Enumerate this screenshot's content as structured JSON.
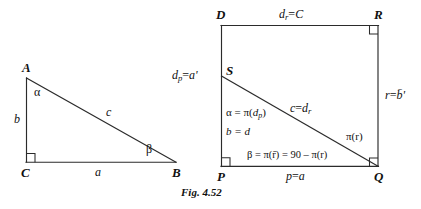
{
  "figure": {
    "caption": "Fig. 4.52",
    "line_color": "#2b2b2b",
    "text_color": "#111111",
    "background": "#ffffff"
  },
  "left_diagram": {
    "name": "right-triangle-ABC",
    "vertices": [
      {
        "id": "A",
        "label": "A",
        "x": 26,
        "y": 78
      },
      {
        "id": "C",
        "label": "C",
        "x": 26,
        "y": 162
      },
      {
        "id": "B",
        "label": "B",
        "x": 176,
        "y": 162
      }
    ],
    "sides": [
      {
        "id": "b",
        "label": "b",
        "from": "A",
        "to": "C"
      },
      {
        "id": "a",
        "label": "a",
        "from": "C",
        "to": "B"
      },
      {
        "id": "c",
        "label": "c",
        "from": "A",
        "to": "B"
      }
    ],
    "angles": [
      {
        "id": "alpha",
        "label": "α",
        "at": "A"
      },
      {
        "id": "beta",
        "label": "β",
        "at": "B"
      },
      {
        "id": "gamma",
        "label": "right-angle",
        "at": "C"
      }
    ]
  },
  "right_diagram": {
    "name": "rectangle-DRQP-with-diagonal-SQ",
    "vertices": [
      {
        "id": "D",
        "label": "D",
        "x": 221,
        "y": 25
      },
      {
        "id": "R",
        "label": "R",
        "x": 378,
        "y": 25
      },
      {
        "id": "Q",
        "label": "Q",
        "x": 378,
        "y": 166
      },
      {
        "id": "P",
        "label": "P",
        "x": 221,
        "y": 166
      },
      {
        "id": "S",
        "label": "S",
        "x": 221,
        "y": 76
      }
    ],
    "edge_labels": {
      "top": {
        "text": "d_r = C",
        "base": "d",
        "sub": "r",
        "rhs": "C"
      },
      "left": {
        "text": "d_p = a'",
        "base": "d",
        "sub": "p",
        "rhs": "a'"
      },
      "right": {
        "text": "r = b̄'",
        "base": "r",
        "rhs": "b̄'"
      },
      "bottom": {
        "text": "p = a",
        "base": "p",
        "rhs": "a"
      }
    },
    "interior_labels": {
      "alpha": {
        "text": "α = π(d_p)",
        "lhs": "α",
        "rhs_fn": "π",
        "rhs_arg_base": "d",
        "rhs_arg_sub": "p"
      },
      "b_eq_d": {
        "text": "b = d"
      },
      "diagonal": {
        "text": "c = d_r",
        "lhs": "c",
        "rhs_base": "d",
        "rhs_sub": "r"
      },
      "pi_r": {
        "text": "π(r)"
      },
      "beta": {
        "text": "β = π(r̄) = 90 – π(r)"
      }
    },
    "right_angle_markers": [
      "R",
      "P",
      "Q"
    ]
  }
}
